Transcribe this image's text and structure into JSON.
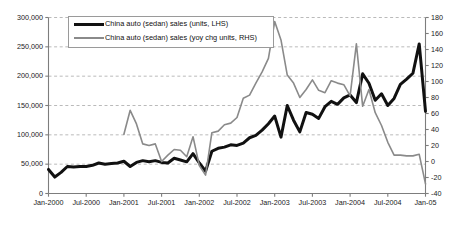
{
  "chart_data": {
    "type": "line",
    "title": "",
    "xlabel": "",
    "ylabel": "",
    "grid": true,
    "legend_position": "top-left-inside",
    "x_tick_labels": [
      "Jan-2000",
      "Jul-2000",
      "Jan-2001",
      "Jul-2001",
      "Jan-2002",
      "Jul-2002",
      "Jan-2003",
      "Jul-2003",
      "Jan-2004",
      "Jul-2004",
      "Jan-05"
    ],
    "axes": {
      "left": {
        "label": "",
        "ylim": [
          0,
          300000
        ],
        "ticks": [
          0,
          50000,
          100000,
          150000,
          200000,
          250000,
          300000
        ],
        "tick_labels": [
          "0",
          "50,000",
          "100,000",
          "150,000",
          "200,000",
          "250,000",
          "300,000"
        ]
      },
      "right": {
        "label": "",
        "ylim": [
          -40,
          180
        ],
        "ticks": [
          -40,
          -20,
          0,
          20,
          40,
          60,
          80,
          100,
          120,
          140,
          160,
          180
        ],
        "tick_labels": [
          "-40",
          "-20",
          "0",
          "20",
          "40",
          "60",
          "80",
          "100",
          "120",
          "140",
          "160",
          "180"
        ]
      }
    },
    "series": [
      {
        "name": "China auto (sedan) sales (units, LHS)",
        "axis": "left",
        "color": "#111111",
        "linewidth": 3,
        "x": [
          "Jan-2000",
          "Feb-2000",
          "Mar-2000",
          "Apr-2000",
          "May-2000",
          "Jun-2000",
          "Jul-2000",
          "Aug-2000",
          "Sep-2000",
          "Oct-2000",
          "Nov-2000",
          "Dec-2000",
          "Jan-2001",
          "Feb-2001",
          "Mar-2001",
          "Apr-2001",
          "May-2001",
          "Jun-2001",
          "Jul-2001",
          "Aug-2001",
          "Sep-2001",
          "Oct-2001",
          "Nov-2001",
          "Dec-2001",
          "Jan-2002",
          "Feb-2002",
          "Mar-2002",
          "Apr-2002",
          "May-2002",
          "Jun-2002",
          "Jul-2002",
          "Aug-2002",
          "Sep-2002",
          "Oct-2002",
          "Nov-2002",
          "Dec-2002",
          "Jan-2003",
          "Feb-2003",
          "Mar-2003",
          "Apr-2003",
          "May-2003",
          "Jun-2003",
          "Jul-2003",
          "Aug-2003",
          "Sep-2003",
          "Oct-2003",
          "Nov-2003",
          "Dec-2003",
          "Jan-2004",
          "Feb-2004",
          "Mar-2004",
          "Apr-2004",
          "May-2004",
          "Jun-2004",
          "Jul-2004",
          "Aug-2004",
          "Sep-2004",
          "Oct-2004",
          "Nov-2004",
          "Dec-2004",
          "Jan-2005"
        ],
        "values": [
          41000,
          28000,
          36000,
          46000,
          45000,
          46000,
          46000,
          48000,
          52000,
          50000,
          51000,
          52000,
          55000,
          46000,
          53000,
          56000,
          54000,
          56000,
          53000,
          52000,
          60000,
          57000,
          54000,
          68000,
          52000,
          38000,
          72000,
          77000,
          79000,
          83000,
          82000,
          86000,
          95000,
          99000,
          108000,
          119000,
          132000,
          96000,
          150000,
          125000,
          105000,
          138000,
          135000,
          128000,
          148000,
          157000,
          152000,
          163000,
          168000,
          155000,
          204000,
          188000,
          159000,
          170000,
          150000,
          162000,
          186000,
          195000,
          205000,
          255000,
          140000
        ]
      },
      {
        "name": "China auto (sedan) sales (yoy chg units, RHS)",
        "axis": "right",
        "color": "#8a8a8a",
        "linewidth": 1.6,
        "x": [
          "Jan-2001",
          "Feb-2001",
          "Mar-2001",
          "Apr-2001",
          "May-2001",
          "Jun-2001",
          "Jul-2001",
          "Aug-2001",
          "Sep-2001",
          "Oct-2001",
          "Nov-2001",
          "Dec-2001",
          "Jan-2002",
          "Feb-2002",
          "Mar-2002",
          "Apr-2002",
          "May-2002",
          "Jun-2002",
          "Jul-2002",
          "Aug-2002",
          "Sep-2002",
          "Oct-2002",
          "Nov-2002",
          "Dec-2002",
          "Jan-2003",
          "Feb-2003",
          "Mar-2003",
          "Apr-2003",
          "May-2003",
          "Jun-2003",
          "Jul-2003",
          "Aug-2003",
          "Sep-2003",
          "Oct-2003",
          "Nov-2003",
          "Dec-2003",
          "Jan-2004",
          "Feb-2004",
          "Mar-2004",
          "Apr-2004",
          "May-2004",
          "Jun-2004",
          "Jul-2004",
          "Aug-2004",
          "Sep-2004",
          "Oct-2004",
          "Nov-2004",
          "Dec-2004",
          "Jan-2005"
        ],
        "values": [
          34,
          64,
          47,
          22,
          20,
          22,
          0,
          8,
          15,
          14,
          6,
          31,
          -5,
          -17,
          36,
          38,
          46,
          48,
          55,
          79,
          83,
          98,
          112,
          129,
          175,
          152,
          108,
          98,
          80,
          90,
          102,
          89,
          86,
          101,
          98,
          96,
          82,
          147,
          69,
          90,
          61,
          45,
          24,
          8,
          8,
          7,
          7,
          9,
          -28
        ]
      }
    ]
  },
  "legend": {
    "items": [
      {
        "label": "China auto (sedan) sales (units, LHS)",
        "marker": "black-line-swatch"
      },
      {
        "label": "China auto (sedan) sales (yoy chg units, RHS)",
        "marker": "grey-line-swatch"
      }
    ]
  },
  "colors": {
    "series_lhs": "#111111",
    "series_rhs": "#8a8a8a",
    "gridline": "#a8a8a8",
    "axis": "#7d7d7d",
    "background": "#ffffff"
  }
}
